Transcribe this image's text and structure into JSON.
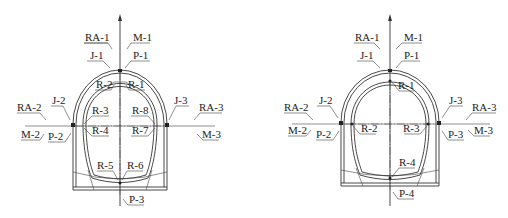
{
  "diagrams": [
    {
      "id": "left",
      "labels": {
        "ra1": "RA-1",
        "m1": "M-1",
        "j1": "J-1",
        "p1": "P-1",
        "r1": "R-1",
        "r2": "R-2",
        "r3": "R-3",
        "r4": "R-4",
        "r5": "R-5",
        "r6": "R-6",
        "r7": "R-7",
        "r8": "R-8",
        "ra2": "RA-2",
        "j2": "J-2",
        "m2": "M-2",
        "p2": "P-2",
        "ra3": "RA-3",
        "j3": "J-3",
        "m3": "M-3",
        "p3": "P-3"
      }
    },
    {
      "id": "right",
      "labels": {
        "ra1": "RA-1",
        "m1": "M-1",
        "j1": "J-1",
        "p1": "P-1",
        "r1": "R-1",
        "r2": "R-2",
        "r3": "R-3",
        "r4": "R-4",
        "ra2": "RA-2",
        "j2": "J-2",
        "m2": "M-2",
        "p2": "P-2",
        "ra3": "RA-3",
        "j3": "J-3",
        "m3": "M-3",
        "p3": "P-3",
        "p4": "P-4"
      }
    }
  ]
}
